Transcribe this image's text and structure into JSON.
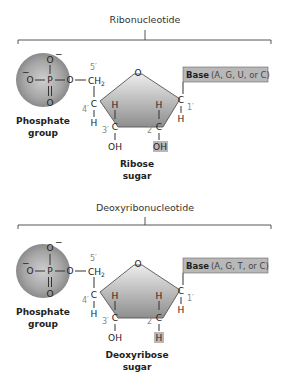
{
  "panels": [
    {
      "title": "Ribonucleotide",
      "phosphate": {
        "label_line1": "Phosphate",
        "label_line2": "group",
        "atoms": {
          "o_top": "O",
          "o_left": "O",
          "p": "P",
          "o_right": "O",
          "o_bottom": "O",
          "charge": "−"
        }
      },
      "sugar": {
        "label_line1": "Ribose",
        "label_line2": "sugar",
        "ring_o": "O",
        "ch2": "CH",
        "ch2_sub": "2",
        "carbons": {
          "c1": "C",
          "c2": "C",
          "c3": "C",
          "c4": "C"
        },
        "positions": {
          "p1": "1′",
          "p2": "2′",
          "p3": "3′",
          "p4": "4′",
          "p5": "5′"
        },
        "h": "H",
        "c3_group": "OH",
        "c2_group": "OH"
      },
      "base": {
        "label": "Base",
        "options": "(A, G, U, or C)"
      }
    },
    {
      "title": "Deoxyribonucleotide",
      "phosphate": {
        "label_line1": "Phosphate",
        "label_line2": "group",
        "atoms": {
          "o_top": "O",
          "o_left": "O",
          "p": "P",
          "o_right": "O",
          "o_bottom": "O",
          "charge": "−"
        }
      },
      "sugar": {
        "label_line1": "Deoxyribose",
        "label_line2": "sugar",
        "ring_o": "O",
        "ch2": "CH",
        "ch2_sub": "2",
        "carbons": {
          "c1": "C",
          "c2": "C",
          "c3": "C",
          "c4": "C"
        },
        "positions": {
          "p1": "1′",
          "p2": "2′",
          "p3": "3′",
          "p4": "4′",
          "p5": "5′"
        },
        "h": "H",
        "c3_group": "OH",
        "c2_group": "H"
      },
      "base": {
        "label": "Base",
        "options": "(A, G, T, or C)"
      }
    }
  ],
  "colors": {
    "highlight_box": "#b8b8b8",
    "ring_fill_light": "#e6e6e6",
    "ring_fill_dark": "#8a8a8a",
    "phosphate_center": "#c8c8c8",
    "phosphate_edge": "#7a7a7a"
  }
}
